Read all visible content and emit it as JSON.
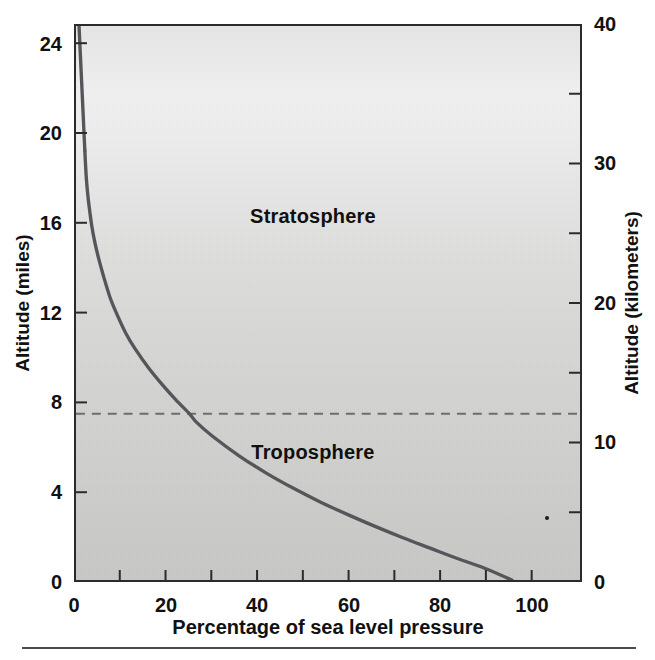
{
  "figure": {
    "background_color": "#ffffff",
    "plot_fill_top": "#efefef",
    "plot_fill_bottom": "#c8c8c7",
    "frame_color": "#2b2b2b",
    "curve_color": "#55565a",
    "tropopause_color": "#6b6c70"
  },
  "axes": {
    "left": {
      "title": "Altitude (miles)",
      "ticks": [
        "0",
        "4",
        "8",
        "12",
        "16",
        "20",
        "24"
      ],
      "tick_values": [
        0,
        4,
        8,
        12,
        16,
        20,
        24
      ],
      "min": 0,
      "max": 24.85
    },
    "right": {
      "title": "Altitude (kilometers)",
      "ticks": [
        "0",
        "10",
        "20",
        "30",
        "40"
      ],
      "tick_values": [
        0,
        10,
        20,
        30,
        40
      ],
      "minor_tick_values": [
        5,
        15,
        25,
        35
      ],
      "min": 0,
      "max": 40
    },
    "bottom": {
      "title": "Percentage of sea level pressure",
      "ticks": [
        "0",
        "20",
        "40",
        "60",
        "80",
        "100"
      ],
      "tick_values": [
        0,
        20,
        40,
        60,
        80,
        100
      ],
      "minor_tick_values": [
        10,
        30,
        50,
        70,
        90
      ],
      "min": 0,
      "max": 111
    }
  },
  "annotations": [
    {
      "name": "stratosphere-label",
      "text": "Stratosphere",
      "x_pct": 47,
      "y_km": 25.2
    },
    {
      "name": "troposphere-label",
      "text": "Troposphere",
      "x_pct": 47,
      "y_km": 9.2
    }
  ],
  "tropopause": {
    "name": "tropopause-line",
    "label": "",
    "altitude_km": 12.0,
    "altitude_miles": 7.4,
    "style": "dashed"
  },
  "chart_data": {
    "type": "line",
    "xlabel": "Percentage of sea level pressure",
    "ylabel": "Altitude (miles)",
    "ylabel_secondary": "Altitude (kilometers)",
    "xlim": [
      0,
      111
    ],
    "ylim_miles": [
      0,
      24.85
    ],
    "ylim_km": [
      0,
      40
    ],
    "grid": false,
    "legend": null,
    "series": [
      {
        "name": "Pressure profile",
        "color": "#55565a",
        "x_label": "Percentage of sea level pressure",
        "y_label": "Altitude (kilometers)",
        "x": [
          96.0,
          90.0,
          84.0,
          78.0,
          72.0,
          66.0,
          60.0,
          54.0,
          48.0,
          42.0,
          36.0,
          30.0,
          26.5,
          25.0,
          22.0,
          19.0,
          16.0,
          13.0,
          11.0,
          9.0,
          7.5,
          6.0,
          5.0,
          4.2,
          3.5,
          3.0,
          2.6,
          2.3,
          2.1,
          1.95
        ],
        "y_km": [
          0.0,
          0.85,
          1.55,
          2.3,
          3.05,
          3.85,
          4.7,
          5.6,
          6.6,
          7.7,
          8.95,
          10.4,
          11.4,
          12.0,
          13.0,
          14.1,
          15.3,
          16.7,
          17.8,
          19.2,
          20.4,
          22.0,
          23.2,
          24.3,
          25.5,
          26.7,
          27.8,
          28.9,
          30.0,
          31.0
        ],
        "y_miles": [
          0.0,
          0.53,
          0.96,
          1.43,
          1.89,
          2.39,
          2.92,
          3.48,
          4.1,
          4.78,
          5.56,
          6.46,
          7.08,
          7.46,
          8.08,
          8.76,
          9.51,
          10.38,
          11.06,
          11.93,
          12.68,
          13.67,
          14.42,
          15.1,
          15.85,
          16.59,
          17.27,
          17.96,
          18.64,
          19.26
        ]
      }
    ],
    "annotations": [
      {
        "text": "Stratosphere",
        "x": 47,
        "y_km": 25.2
      },
      {
        "text": "Troposphere",
        "x": 47,
        "y_km": 9.2
      },
      {
        "text": "tropopause (dashed line)",
        "x": null,
        "y_km": 12.0
      }
    ]
  }
}
